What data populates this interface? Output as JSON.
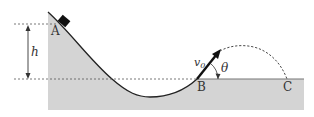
{
  "diagram": {
    "labels": {
      "point_a": "A",
      "point_b": "B",
      "point_c": "C",
      "height": "h",
      "velocity": "v",
      "velocity_sub": "0",
      "angle": "θ"
    },
    "colors": {
      "ground_fill": "#d4d4d4",
      "line": "#222222",
      "dashed": "#555555",
      "block": "#111111",
      "text": "#333333"
    }
  }
}
